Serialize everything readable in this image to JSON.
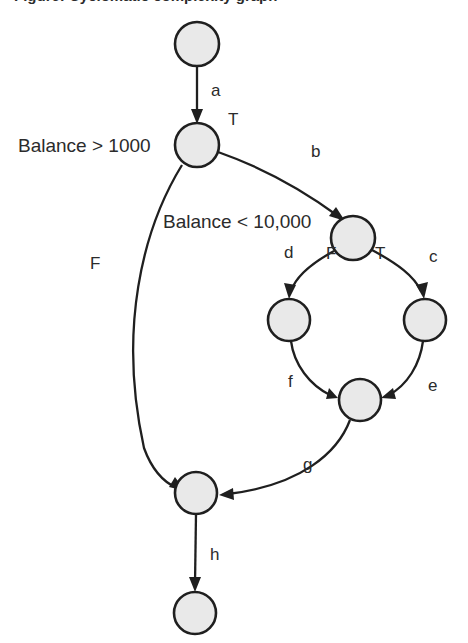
{
  "diagram": {
    "title_partial": "Figure: Cyclomatic complexity graph",
    "type": "control-flow-graph",
    "colors": {
      "node_fill": "#e9e9e9",
      "node_stroke": "#1f1f1f",
      "edge_stroke": "#1f1f1f",
      "text": "#2b2b2b",
      "background": "#ffffff"
    },
    "nodes": [
      {
        "id": "n1",
        "name": "start-node",
        "cx": 197,
        "cy": 44,
        "r": 22
      },
      {
        "id": "n2",
        "name": "decision-node-1",
        "cx": 197,
        "cy": 145,
        "r": 22
      },
      {
        "id": "n3",
        "name": "decision-node-2",
        "cx": 353,
        "cy": 238,
        "r": 22
      },
      {
        "id": "n4",
        "name": "branch-node-left",
        "cx": 289,
        "cy": 320,
        "r": 21
      },
      {
        "id": "n5",
        "name": "branch-node-right",
        "cx": 425,
        "cy": 320,
        "r": 21
      },
      {
        "id": "n6",
        "name": "join-node",
        "cx": 360,
        "cy": 400,
        "r": 21
      },
      {
        "id": "n7",
        "name": "merge-node",
        "cx": 196,
        "cy": 493,
        "r": 21
      },
      {
        "id": "n8",
        "name": "end-node",
        "cx": 195,
        "cy": 613,
        "r": 21
      }
    ],
    "edges": [
      {
        "id": "a",
        "label": "a",
        "from": "n1",
        "to": "n2",
        "label_x": 211,
        "label_y": 96
      },
      {
        "id": "b",
        "label": "b",
        "from": "n2",
        "to": "n3",
        "label_x": 311,
        "label_y": 157
      },
      {
        "id": "c",
        "label": "c",
        "from": "n3",
        "to": "n5",
        "label_x": 429,
        "label_y": 262
      },
      {
        "id": "d",
        "label": "d",
        "from": "n3",
        "to": "n4",
        "label_x": 284,
        "label_y": 258
      },
      {
        "id": "e",
        "label": "e",
        "from": "n5",
        "to": "n6",
        "label_x": 428,
        "label_y": 391
      },
      {
        "id": "f",
        "label": "f",
        "from": "n4",
        "to": "n6",
        "label_x": 288,
        "label_y": 387
      },
      {
        "id": "g",
        "label": "g",
        "from": "n6",
        "to": "n7",
        "label_x": 303,
        "label_y": 470
      },
      {
        "id": "h",
        "label": "h",
        "from": "n7",
        "to": "n8",
        "label_x": 210,
        "label_y": 560
      },
      {
        "id": "F1",
        "label": "F",
        "from": "n2",
        "to": "n7",
        "label_x": 90,
        "label_y": 269
      }
    ],
    "branch_labels": [
      {
        "id": "t1",
        "label": "T",
        "x": 228,
        "y": 125,
        "name": "branch-label-true-1"
      },
      {
        "id": "f2",
        "label": "F",
        "x": 326,
        "y": 259,
        "name": "branch-label-false-2"
      },
      {
        "id": "t2",
        "label": "T",
        "x": 375,
        "y": 259,
        "name": "branch-label-true-2"
      }
    ],
    "condition_labels": [
      {
        "id": "c1",
        "label": "Balance > 1000",
        "x": 18,
        "y": 152,
        "name": "condition-label-balance-greater"
      },
      {
        "id": "c2",
        "label": "Balance < 10,000",
        "x": 163,
        "y": 228,
        "name": "condition-label-balance-less"
      }
    ]
  }
}
